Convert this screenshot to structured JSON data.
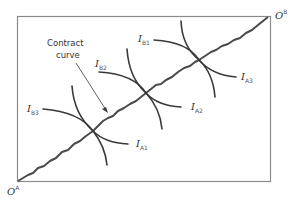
{
  "diagram": {
    "type": "edgeworth-box",
    "origin_a": {
      "base": "O",
      "sup": "A"
    },
    "origin_b": {
      "base": "O",
      "sup": "B"
    },
    "contract_curve_label": [
      "Contract",
      "curve"
    ],
    "indifference_curves_a": [
      {
        "base": "I",
        "sub": "A1"
      },
      {
        "base": "I",
        "sub": "A2"
      },
      {
        "base": "I",
        "sub": "A3"
      }
    ],
    "indifference_curves_b": [
      {
        "base": "I",
        "sub": "B1"
      },
      {
        "base": "I",
        "sub": "B2"
      },
      {
        "base": "I",
        "sub": "B3"
      }
    ],
    "colors": {
      "line": "#3a3a3a",
      "box": "#8a8a8a",
      "background": "#ffffff"
    }
  }
}
